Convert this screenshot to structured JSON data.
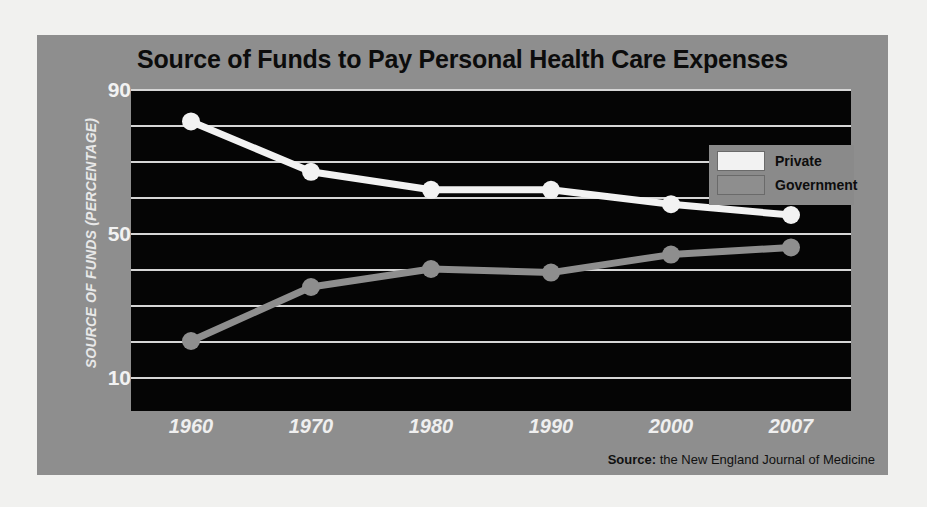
{
  "page": {
    "background_color": "#f1f1ef",
    "card_color": "#8e8e8e"
  },
  "header": {
    "title": "Source of Funds to Pay Personal Health Care Expenses"
  },
  "legend": {
    "position": "top-right",
    "background_color": "#8a8a8a",
    "entries": [
      {
        "label": "Private",
        "color": "#f2f2f2"
      },
      {
        "label": "Government",
        "color": "#8e8e8e"
      }
    ]
  },
  "source": {
    "prefix": "Source:",
    "text": " the New England Journal of Medicine"
  },
  "axes": {
    "y_title": "SOURCE OF FUNDS (PERCENTAGE)",
    "y_ticks": [
      "90",
      "50",
      "10"
    ],
    "x_ticks": [
      "1960",
      "1970",
      "1980",
      "1990",
      "2000",
      "2007"
    ]
  },
  "chart_data": {
    "type": "line",
    "title": "Source of Funds to Pay Personal Health Care Expenses",
    "xlabel": "",
    "ylabel": "SOURCE OF FUNDS (PERCENTAGE)",
    "categories": [
      "1960",
      "1970",
      "1980",
      "1990",
      "2000",
      "2007"
    ],
    "x": [
      1960,
      1970,
      1980,
      1990,
      2000,
      2007
    ],
    "series": [
      {
        "name": "Private",
        "color": "#f2f2f2",
        "values": [
          81,
          67,
          62,
          62,
          58,
          55
        ]
      },
      {
        "name": "Government",
        "color": "#8e8e8e",
        "values": [
          20,
          35,
          40,
          39,
          44,
          46
        ]
      }
    ],
    "ylim": [
      0,
      90
    ],
    "ytick_values": [
      90,
      50,
      10
    ],
    "grid": true,
    "grid_values": [
      90,
      80,
      70,
      60,
      50,
      40,
      30,
      20,
      10
    ],
    "legend_position": "top-right",
    "annotations": [
      "Source: the New England Journal of Medicine"
    ]
  }
}
